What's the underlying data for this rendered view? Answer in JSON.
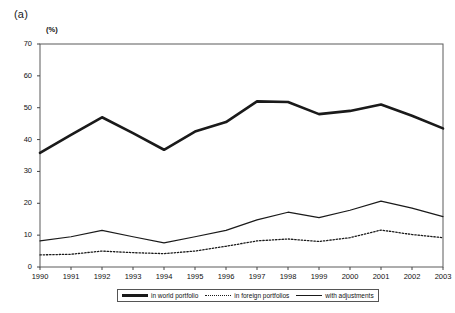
{
  "figure": {
    "panel_label": "(a)",
    "y_unit_label": "(%)"
  },
  "legend": {
    "items": [
      {
        "label": "in world portfolio",
        "style": "thick-solid"
      },
      {
        "label": "in foreign portfolios",
        "style": "dotted"
      },
      {
        "label": "with adjustments",
        "style": "thin-solid"
      }
    ]
  },
  "chart_data": {
    "type": "line",
    "title": "(a)",
    "xlabel": "",
    "ylabel": "(%)",
    "ylim": [
      0,
      70
    ],
    "yticks": [
      0,
      10,
      20,
      30,
      40,
      50,
      60,
      70
    ],
    "grid": false,
    "legend_position": "bottom",
    "categories": [
      "1990",
      "1991",
      "1992",
      "1993",
      "1994",
      "1995",
      "1996",
      "1997",
      "1998",
      "1999",
      "2000",
      "2001",
      "2002",
      "2003"
    ],
    "x": [
      1990,
      1991,
      1992,
      1993,
      1994,
      1995,
      1996,
      1997,
      1998,
      1999,
      2000,
      2001,
      2002,
      2003
    ],
    "series": [
      {
        "name": "with adjustments",
        "style": "thick-solid",
        "values": [
          35.8,
          41.5,
          47.0,
          42.0,
          36.8,
          42.5,
          45.5,
          52.0,
          51.8,
          48.0,
          49.0,
          51.0,
          47.5,
          43.5
        ]
      },
      {
        "name": "in world portfolio",
        "style": "thin-solid",
        "values": [
          8.2,
          9.5,
          11.5,
          9.5,
          7.6,
          9.5,
          11.5,
          14.8,
          17.2,
          15.5,
          17.8,
          20.7,
          18.5,
          15.8
        ]
      },
      {
        "name": "in foreign portfolios",
        "style": "dotted",
        "values": [
          3.8,
          4.0,
          5.0,
          4.5,
          4.2,
          5.0,
          6.5,
          8.2,
          8.8,
          8.0,
          9.2,
          11.6,
          10.2,
          9.2
        ]
      }
    ]
  }
}
